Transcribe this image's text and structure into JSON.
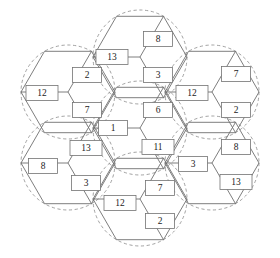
{
  "figure": {
    "caption": "",
    "geometry": {
      "hex_radius": 47,
      "circle_radius": 47,
      "centers": [
        {
          "id": "center",
          "x": 140,
          "y": 128
        },
        {
          "id": "top",
          "x": 140,
          "y": 57
        },
        {
          "id": "upper-right",
          "x": 212,
          "y": 92
        },
        {
          "id": "lower-right",
          "x": 212,
          "y": 163
        },
        {
          "id": "bottom",
          "x": 140,
          "y": 199
        },
        {
          "id": "lower-left",
          "x": 68,
          "y": 163
        },
        {
          "id": "upper-left",
          "x": 68,
          "y": 92
        }
      ]
    },
    "colors": {
      "hex_edge": "#6f6f6f",
      "coverage_circle": "#8a8a8a",
      "label_border": "#737373",
      "label_fill": "#ffffff",
      "label_text": "#1b1b1b",
      "background": "#ffffff"
    }
  },
  "chart_data": {
    "type": "diagram",
    "title": "",
    "cells": [
      {
        "id": "center",
        "cx": 140,
        "cy": 128,
        "sectors": [
          {
            "position": "left",
            "value": "1",
            "lx": 113,
            "ly": 128
          },
          {
            "position": "upper-right",
            "value": "6",
            "lx": 158,
            "ly": 110
          },
          {
            "position": "lower-right",
            "value": "11",
            "lx": 158,
            "ly": 147
          }
        ]
      },
      {
        "id": "top",
        "cx": 140,
        "cy": 57,
        "sectors": [
          {
            "position": "left",
            "value": "13",
            "lx": 112,
            "ly": 57
          },
          {
            "position": "upper-right",
            "value": "8",
            "lx": 158,
            "ly": 39
          },
          {
            "position": "lower-right",
            "value": "3",
            "lx": 158,
            "ly": 75
          }
        ]
      },
      {
        "id": "upper-right",
        "cx": 212,
        "cy": 92,
        "sectors": [
          {
            "position": "left",
            "value": "12",
            "lx": 192,
            "ly": 93
          },
          {
            "position": "upper-right",
            "value": "7",
            "lx": 236,
            "ly": 74
          },
          {
            "position": "lower-right",
            "value": "2",
            "lx": 236,
            "ly": 110
          }
        ]
      },
      {
        "id": "lower-right",
        "cx": 212,
        "cy": 163,
        "sectors": [
          {
            "position": "left",
            "value": "3",
            "lx": 193,
            "ly": 164
          },
          {
            "position": "upper-right",
            "value": "8",
            "lx": 236,
            "ly": 147
          },
          {
            "position": "lower-right",
            "value": "13",
            "lx": 236,
            "ly": 182
          }
        ]
      },
      {
        "id": "bottom",
        "cx": 140,
        "cy": 199,
        "sectors": [
          {
            "position": "left",
            "value": "12",
            "lx": 120,
            "ly": 203
          },
          {
            "position": "upper-right",
            "value": "7",
            "lx": 160,
            "ly": 188
          },
          {
            "position": "lower-right",
            "value": "2",
            "lx": 160,
            "ly": 221
          }
        ]
      },
      {
        "id": "lower-left",
        "cx": 68,
        "cy": 163,
        "sectors": [
          {
            "position": "left",
            "value": "8",
            "lx": 43,
            "ly": 166
          },
          {
            "position": "upper-right",
            "value": "13",
            "lx": 86,
            "ly": 148
          },
          {
            "position": "lower-right",
            "value": "3",
            "lx": 86,
            "ly": 183
          }
        ]
      },
      {
        "id": "upper-left",
        "cx": 68,
        "cy": 92,
        "sectors": [
          {
            "position": "left",
            "value": "12",
            "lx": 42,
            "ly": 93
          },
          {
            "position": "upper-right",
            "value": "2",
            "lx": 87,
            "ly": 75
          },
          {
            "position": "lower-right",
            "value": "7",
            "lx": 87,
            "ly": 110
          }
        ]
      }
    ]
  }
}
